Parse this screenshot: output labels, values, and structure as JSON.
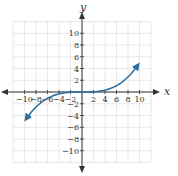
{
  "chart_data": {
    "type": "line",
    "title": "",
    "xlabel": "x",
    "ylabel": "y",
    "xlim": [
      -12,
      12
    ],
    "ylim": [
      -12,
      12
    ],
    "grid": true,
    "grid_step": 2,
    "x_ticks": [
      -10,
      -8,
      -6,
      -4,
      -2,
      2,
      4,
      6,
      8,
      10
    ],
    "y_ticks": [
      10,
      8,
      6,
      4,
      2,
      -2,
      -4,
      -6,
      -8,
      -10
    ],
    "x_tick_labels": [
      "−10",
      "−8",
      "−6",
      "−4",
      "−2",
      "2",
      "4",
      "6",
      "8",
      "10"
    ],
    "y_tick_labels": [
      "10",
      "8",
      "6",
      "4",
      "2",
      "−2",
      "−4",
      "−6",
      "−8",
      "−10"
    ],
    "series": [
      {
        "name": "f(x) ≈ x³/200",
        "color": "#2e6f9e",
        "arrows_both_ends": true,
        "x": [
          -9.7,
          -8,
          -6,
          -4,
          -2,
          0,
          2,
          4,
          6,
          8,
          9.7
        ],
        "y": [
          -4.56,
          -2.56,
          -1.08,
          -0.32,
          -0.04,
          0,
          0.04,
          0.32,
          1.08,
          2.56,
          4.56
        ]
      }
    ]
  },
  "colors": {
    "grid": "#e2e2e2",
    "axis": "#333333",
    "curve": "#2e6f9e"
  }
}
